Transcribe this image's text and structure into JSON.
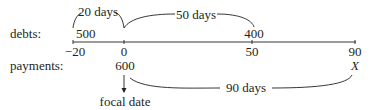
{
  "diagram": {
    "type": "time-line",
    "row_labels": {
      "debts": "debts:",
      "payments": "payments:"
    },
    "axis": {
      "ticks": [
        {
          "value": "−20",
          "x": 73
        },
        {
          "value": "0",
          "x": 124
        },
        {
          "value": "50",
          "x": 252
        },
        {
          "value": "90",
          "x": 355
        }
      ]
    },
    "debts": [
      {
        "amount": "500",
        "time": "−20"
      },
      {
        "amount": "400",
        "time": "50"
      }
    ],
    "payments": [
      {
        "amount": "600",
        "time": "0"
      },
      {
        "amount": "X",
        "time": "90"
      }
    ],
    "intervals": [
      {
        "label": "20 days",
        "from": "−20",
        "to": "0",
        "row": "debts"
      },
      {
        "label": "50 days",
        "from": "0",
        "to": "50",
        "row": "debts"
      },
      {
        "label": "90 days",
        "from": "0",
        "to": "90",
        "row": "payments"
      }
    ],
    "focal_date": {
      "label": "focal date",
      "time": "0"
    },
    "colors": {
      "ink": "#231f20",
      "background": "#ffffff"
    }
  }
}
